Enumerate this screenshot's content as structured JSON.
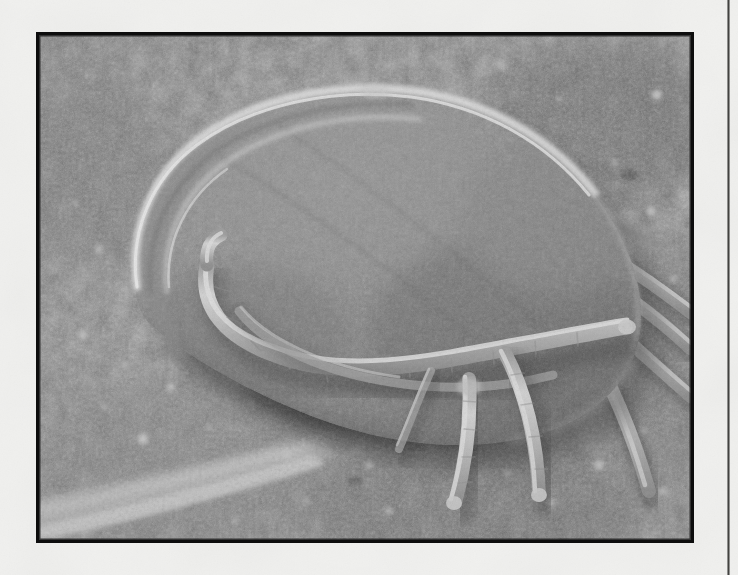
{
  "page": {
    "background_color": "#f1f1ef",
    "gutter_rule": {
      "name": "page-gutter-rule",
      "color": "#3a3a38",
      "x": 727,
      "width": 3
    }
  },
  "figure": {
    "frame": {
      "x": 36,
      "y": 32,
      "width": 658,
      "height": 511,
      "border_color": "#0d0d0d",
      "border_width": 3
    },
    "image_type": "scanning-electron-micrograph",
    "color_mode": "grayscale",
    "caption": "",
    "palette": {
      "substrate_mid": "#6e6e6e",
      "substrate_dark": "#4a4a4a",
      "substrate_light": "#9a9a9a",
      "body_fill": "#7b7b7b",
      "body_shade": "#5e5e5e",
      "body_rim_highlight": "#d8d8d8",
      "leg_highlight": "#cfcfcf",
      "leg_core": "#b4b4b4",
      "deep_shadow": "#2a2a2a",
      "specular": "#ededed"
    }
  },
  "micrograph_content": {
    "body": {
      "name": "mite-body",
      "description": "large ovoid idiosoma filling the upper-left and centre of the frame, tilted with the anterior end toward the lower-left",
      "center": [
        330,
        215
      ],
      "radius_x": 215,
      "radius_y": 160,
      "rotation_deg": -24
    },
    "rim_ridge": {
      "name": "body-rim-ridge",
      "description": "bright cuticular ridge outlining the dorsal/anterior margin of the body"
    },
    "front_leg": {
      "name": "front-leg",
      "description": "long slender leg curving from the upper-left around the anterior margin and sweeping to the right across the mid-frame"
    },
    "ventral_legs": [
      {
        "name": "ventral-leg-1",
        "description": "leg descending from the mid-body down and slightly left, ending near the lower-centre"
      },
      {
        "name": "ventral-leg-2",
        "description": "leg descending from the mid-body down and right, tip near lower-centre-right"
      }
    ],
    "posterior_legs": [
      {
        "name": "posterior-leg-1",
        "description": "leg fanning from the right side of the body toward the upper-right edge"
      },
      {
        "name": "posterior-leg-2",
        "description": "leg fanning from the right side of the body toward the right edge"
      },
      {
        "name": "posterior-leg-3",
        "description": "leg fanning from the right side of the body toward the lower-right edge"
      },
      {
        "name": "posterior-leg-4",
        "description": "leg descending from the right side of the body toward the bottom-right"
      }
    ],
    "substrate": {
      "name": "substrate-surface",
      "description": "granular particulate surface with scattered bright spherical debris"
    },
    "substrate_ridge": {
      "name": "substrate-ridge",
      "description": "bright diagonal ridge of material crossing the lower-left corner"
    },
    "under_body_shadow": {
      "name": "under-body-shadow",
      "description": "dark shadow band beneath the ventral surface of the mite"
    },
    "debris_particles_count": 38
  }
}
